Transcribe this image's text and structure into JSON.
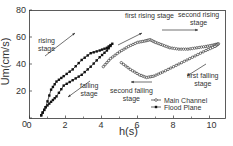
{
  "chart_data": {
    "type": "line",
    "title": "",
    "xlabel": "h(s)",
    "ylabel": "Um(cm/s)",
    "xlim": [
      0,
      11
    ],
    "ylim": [
      0,
      80
    ],
    "xticks": [
      0,
      2,
      4,
      6,
      8,
      10
    ],
    "yticks": [
      0,
      20,
      40,
      60,
      80
    ],
    "grid": false,
    "legend_position": "lower right",
    "series": [
      {
        "name": "Main Channel",
        "marker": "open-circle",
        "x": [
          4.1,
          4.5,
          5.0,
          5.5,
          6.0,
          6.4,
          6.7,
          7.0,
          7.4,
          7.8,
          8.3,
          8.8,
          9.3,
          9.8,
          10.2,
          10.5,
          10.3,
          9.8,
          9.2,
          8.6,
          8.0,
          7.4,
          6.9,
          6.5,
          6.1,
          5.6,
          5.1
        ],
        "y": [
          38,
          44,
          49,
          53,
          56,
          57,
          58,
          56,
          54,
          52,
          51,
          51,
          52,
          53,
          54,
          55,
          53,
          50,
          46,
          42,
          38,
          34,
          31,
          30,
          32,
          36,
          41
        ]
      },
      {
        "name": "Flood Plane",
        "marker": "filled-square",
        "x": [
          0.65,
          0.9,
          1.2,
          1.5,
          1.9,
          2.4,
          2.9,
          3.4,
          3.9,
          4.3,
          4.6,
          4.3,
          3.9,
          3.4,
          2.9,
          2.4,
          1.9,
          1.5,
          1.2,
          0.9,
          0.65
        ],
        "y": [
          2,
          8,
          21,
          27,
          31,
          36,
          43,
          48,
          50,
          52,
          55,
          50,
          45,
          38,
          32,
          28,
          24,
          16,
          12,
          8,
          2
        ]
      }
    ],
    "annotations": [
      {
        "text": "rising stage",
        "x": 1.5,
        "y": 46
      },
      {
        "text": "falling stage",
        "x": 3.3,
        "y": 20
      },
      {
        "text": "first rising stage",
        "x": 6.3,
        "y": 68
      },
      {
        "text": "second rising stage",
        "x": 9.0,
        "y": 69
      },
      {
        "text": "first falling stage",
        "x": 9.8,
        "y": 31
      },
      {
        "text": "second falling stage",
        "x": 5.5,
        "y": 20
      }
    ]
  }
}
